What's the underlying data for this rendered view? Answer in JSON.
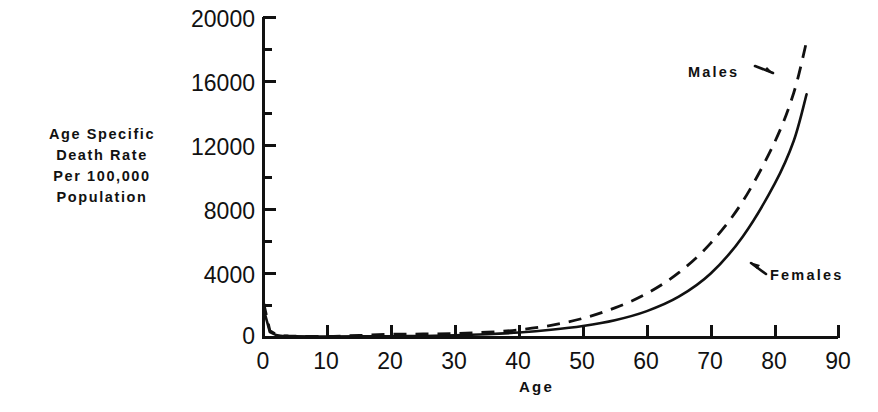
{
  "chart_data": {
    "type": "line",
    "title": "",
    "subtitle": "",
    "xlabel": "Age",
    "ylabel": "Age Specific Death Rate Per 100,000 Population",
    "ylabel_lines": [
      "Age Specific",
      "Death Rate",
      "Per 100,000",
      "Population"
    ],
    "xlim": [
      0,
      90
    ],
    "ylim": [
      0,
      20000
    ],
    "grid": false,
    "legend_position": "inline-annotations",
    "x_major_ticks": [
      0,
      10,
      20,
      30,
      40,
      50,
      60,
      70,
      80,
      90
    ],
    "x_minor_ticks": [
      5,
      15,
      25,
      35,
      45,
      55,
      65,
      75,
      85
    ],
    "x_tick_labels": [
      "0",
      "10",
      "20",
      "30",
      "40",
      "50",
      "60",
      "70",
      "80",
      "90"
    ],
    "y_major_ticks": [
      0,
      4000,
      8000,
      12000,
      16000,
      20000
    ],
    "y_minor_ticks": [
      2000,
      6000,
      10000,
      14000,
      18000
    ],
    "y_tick_labels": [
      "0",
      "4000",
      "8000",
      "12000",
      "16000",
      "20000"
    ],
    "annotations": [
      {
        "text": "Males",
        "target_series": "Males",
        "x": 85,
        "y": 16500
      },
      {
        "text": "Females",
        "target_series": "Females",
        "x": 81,
        "y": 4200
      }
    ],
    "series": [
      {
        "name": "Males",
        "style": "dashed",
        "color": "#111111",
        "x": [
          0,
          1,
          2,
          3,
          4,
          5,
          10,
          15,
          20,
          25,
          30,
          35,
          40,
          45,
          50,
          55,
          60,
          65,
          70,
          75,
          80,
          83,
          85
        ],
        "values": [
          2200,
          420,
          180,
          110,
          90,
          80,
          70,
          130,
          200,
          220,
          250,
          330,
          480,
          760,
          1200,
          1850,
          2750,
          4050,
          5900,
          8500,
          12200,
          15300,
          18500
        ]
      },
      {
        "name": "Females",
        "style": "solid",
        "color": "#111111",
        "x": [
          0,
          1,
          2,
          3,
          4,
          5,
          10,
          15,
          20,
          25,
          30,
          35,
          40,
          45,
          50,
          55,
          60,
          65,
          70,
          75,
          80,
          83,
          85
        ],
        "values": [
          1800,
          340,
          150,
          95,
          80,
          70,
          60,
          70,
          80,
          95,
          130,
          200,
          310,
          480,
          720,
          1080,
          1650,
          2550,
          4000,
          6300,
          9600,
          12300,
          15200
        ]
      }
    ]
  },
  "axes": {
    "x_axis_name": "Age",
    "y_axis_name": "Age Specific Death Rate Per 100,000 Population"
  }
}
